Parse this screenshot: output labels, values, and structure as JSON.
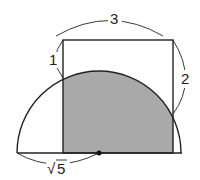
{
  "diagram": {
    "labels": {
      "top": "3",
      "left_segment": "1",
      "right_segment": "2",
      "radius": "5",
      "radius_prefix": "√"
    },
    "colors": {
      "shade": "#a9a9a9",
      "stroke": "#222222"
    }
  }
}
